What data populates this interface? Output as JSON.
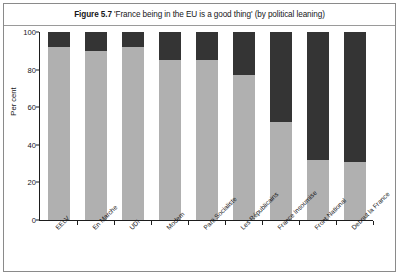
{
  "figure": {
    "number": "Figure 5.7",
    "caption": "'France being in the EU is a good thing' (by political leaning)",
    "full_title": "Figure 5.7 'France being in the EU is a good thing' (by political leaning)"
  },
  "colors": {
    "agree": "#b0b0b0",
    "disagree": "#343434",
    "axis": "#1d1d1d",
    "frame": "#8a8a8a",
    "background": "#ffffff",
    "text": "#17171a"
  },
  "chart_data": {
    "type": "bar",
    "stacked": true,
    "title": "'France being in the EU is a good thing' (by political leaning)",
    "xlabel": "",
    "ylabel": "Per cent",
    "ylim": [
      0,
      100
    ],
    "yticks": [
      0,
      20,
      40,
      60,
      80,
      100
    ],
    "ytick_labels": [
      "0",
      "20",
      "40",
      "60",
      "80",
      "100"
    ],
    "grid": false,
    "legend": false,
    "categories": [
      "EELV",
      "En Marche",
      "UDI",
      "Modem",
      "Parti Socialiste",
      "Les Républicains",
      "France Insoumise",
      "Front National",
      "Debout la France"
    ],
    "series": [
      {
        "name": "Agree",
        "color": "#b0b0b0",
        "values": [
          92,
          90,
          92,
          85,
          85,
          77,
          52,
          32,
          31
        ]
      },
      {
        "name": "Disagree",
        "color": "#343434",
        "values": [
          8,
          10,
          8,
          15,
          15,
          23,
          48,
          68,
          69
        ]
      }
    ]
  }
}
